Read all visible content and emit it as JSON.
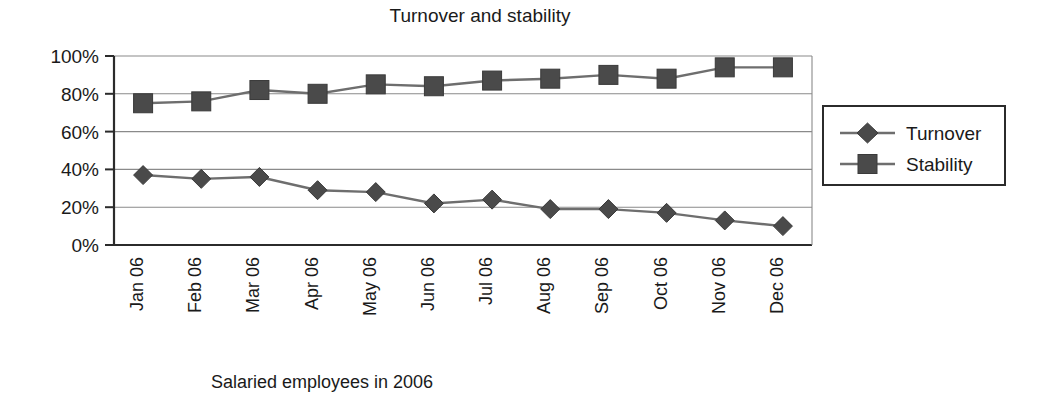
{
  "chart_data": {
    "type": "line",
    "title": "Turnover and stability",
    "xlabel": "Salaried employees in 2006",
    "ylabel": "",
    "categories": [
      "Jan 06",
      "Feb 06",
      "Mar 06",
      "Apr 06",
      "May 06",
      "Jun 06",
      "Jul 06",
      "Aug 06",
      "Sep 06",
      "Oct 06",
      "Nov 06",
      "Dec 06"
    ],
    "series": [
      {
        "name": "Turnover",
        "marker": "diamond",
        "values": [
          37,
          35,
          36,
          29,
          28,
          22,
          24,
          19,
          19,
          17,
          13,
          10
        ]
      },
      {
        "name": "Stability",
        "marker": "square",
        "values": [
          75,
          76,
          82,
          80,
          85,
          84,
          87,
          88,
          90,
          88,
          94,
          94
        ]
      }
    ],
    "ylim": [
      0,
      100
    ],
    "ytick_labels": [
      "0%",
      "20%",
      "40%",
      "60%",
      "80%",
      "100%"
    ],
    "ytick_values": [
      0,
      20,
      40,
      60,
      80,
      100
    ],
    "grid": true,
    "legend_position": "right",
    "colors": {
      "line": "#6e6e6e",
      "marker": "#4a4a4a",
      "axis": "#2b2b2b",
      "grid": "#8a8a8a",
      "text": "#1a1a1a",
      "background": "#ffffff"
    }
  }
}
